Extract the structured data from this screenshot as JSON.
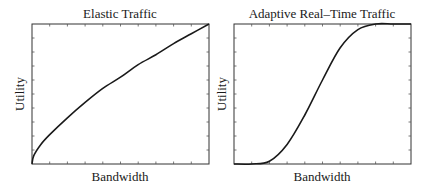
{
  "chart_data": [
    {
      "type": "line",
      "title": "Elastic Traffic",
      "xlabel": "Bandwidth",
      "ylabel": "Utility",
      "xlim": [
        0,
        1
      ],
      "ylim": [
        0,
        1
      ],
      "grid": false,
      "ticks": {
        "x_count": 10,
        "y_count": 10,
        "labels": false
      },
      "series": [
        {
          "name": "Elastic utility (concave)",
          "x": [
            0,
            0.01,
            0.05,
            0.1,
            0.2,
            0.3,
            0.4,
            0.5,
            0.6,
            0.7,
            0.8,
            0.9,
            1.0
          ],
          "values": [
            0,
            0.06,
            0.14,
            0.21,
            0.33,
            0.44,
            0.54,
            0.62,
            0.71,
            0.78,
            0.86,
            0.93,
            1.0
          ]
        }
      ]
    },
    {
      "type": "line",
      "title": "Adaptive Real–Time Traffic",
      "xlabel": "Bandwidth",
      "ylabel": "Utility",
      "xlim": [
        0,
        1
      ],
      "ylim": [
        0,
        1
      ],
      "grid": false,
      "ticks": {
        "x_count": 10,
        "y_count": 10,
        "labels": false
      },
      "series": [
        {
          "name": "Adaptive real-time utility (sigmoid)",
          "x": [
            0,
            0.1,
            0.2,
            0.3,
            0.4,
            0.5,
            0.6,
            0.7,
            0.8,
            0.9,
            1.0
          ],
          "values": [
            0,
            0.0,
            0.02,
            0.14,
            0.35,
            0.6,
            0.83,
            0.96,
            1.0,
            1.0,
            1.0
          ]
        }
      ]
    }
  ]
}
